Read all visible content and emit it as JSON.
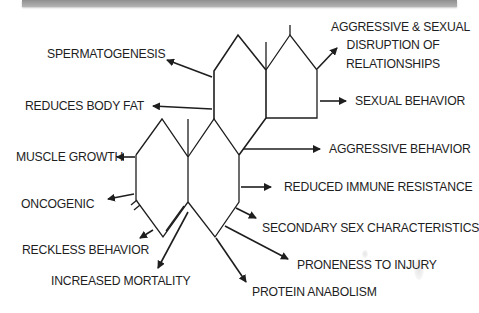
{
  "diagram": {
    "type": "steroid-structure-effects",
    "structure": "steroid four-ring skeleton (testosterone / anabolic steroid)",
    "line_color": "#1e1e1e",
    "banner_color": "#a0a0a0",
    "labels": {
      "aggressive_sexual": "AGGRESSIVE & SEXUAL",
      "disruption_of": "DISRUPTION OF",
      "relationships": "RELATIONSHIPS",
      "spermatogenesis": "SPERMATOGENESIS",
      "reduces_body_fat": "REDUCES BODY FAT",
      "sexual_behavior": "SEXUAL BEHAVIOR",
      "muscle_growth": "MUSCLE GROWTH",
      "aggressive_behavior": "AGGRESSIVE BEHAVIOR",
      "reduced_immune_resistance": "REDUCED IMMUNE RESISTANCE",
      "oncogenic": "ONCOGENIC",
      "secondary_sex_characteristics": "SECONDARY SEX CHARACTERISTICS",
      "reckless_behavior": "RECKLESS BEHAVIOR",
      "proneness_to_injury": "PRONENESS TO INJURY",
      "increased_mortality": "INCREASED MORTALITY",
      "protein_anabolism": "PROTEIN ANABOLISM"
    }
  }
}
